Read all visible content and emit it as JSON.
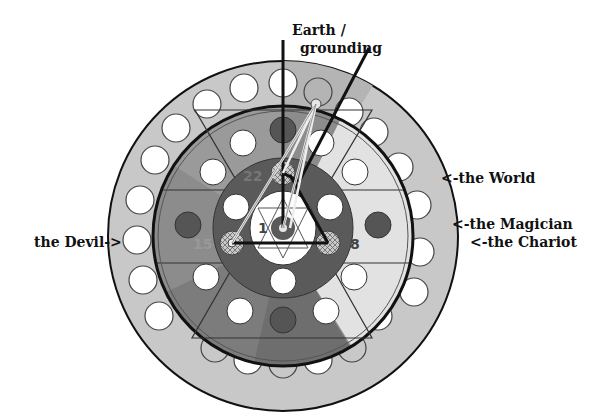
{
  "labels": {
    "earth_line1": "Earth /",
    "earth_line2": "grounding",
    "world": "<-the World",
    "magician": "<-the Magician",
    "chariot": "<-the Chariot",
    "devil": "the Devil->"
  },
  "numbers": {
    "n22": "22",
    "n1": "1",
    "n15": "15",
    "n8": "8"
  },
  "colors": {
    "outer_ring": "#c8c8c8",
    "mid_ring": "#8c8c8c",
    "dark_sector": "#6e6e6e",
    "light_sector": "#e2e2e2",
    "inner_disk": "#5a5a5a",
    "dark_dot": "#555555",
    "white": "#ffffff",
    "line": "#111111"
  }
}
